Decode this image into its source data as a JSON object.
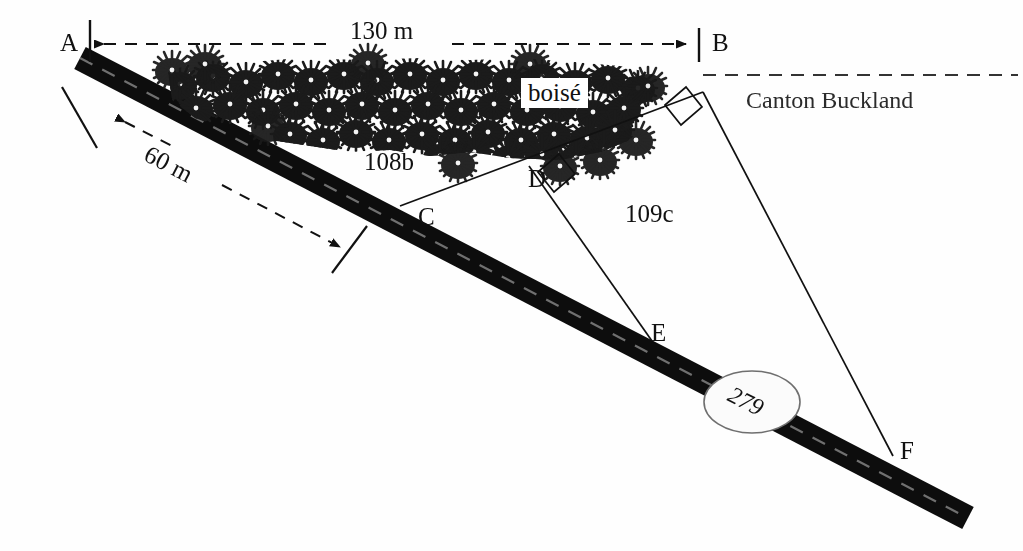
{
  "diagram": {
    "background_color": "#fefefe",
    "ink_color": "#111111",
    "road_color": "#111111",
    "points": [
      {
        "id": "A",
        "label": "A",
        "x": 68,
        "y": 45,
        "kind": "corner-marker"
      },
      {
        "id": "B",
        "label": "B",
        "x": 712,
        "y": 45,
        "kind": "corner-marker"
      },
      {
        "id": "C",
        "label": "C",
        "x": 418,
        "y": 217,
        "kind": "road-intersection"
      },
      {
        "id": "D",
        "label": "D",
        "x": 529,
        "y": 180,
        "kind": "line-vertex"
      },
      {
        "id": "E",
        "label": "E",
        "x": 652,
        "y": 334,
        "kind": "road-intersection"
      },
      {
        "id": "F",
        "label": "F",
        "x": 902,
        "y": 452,
        "kind": "road-intersection"
      }
    ],
    "parcels": [
      {
        "id": "108b",
        "label": "108b",
        "x": 364,
        "y": 161
      },
      {
        "id": "109c",
        "label": "109c",
        "x": 625,
        "y": 213
      }
    ],
    "dimensions": [
      {
        "id": "ab",
        "label": "130 m",
        "x": 350,
        "y": 30,
        "rotated": false,
        "from": "A",
        "to": "B",
        "style": "dashed-double-arrow"
      },
      {
        "id": "a60",
        "label": "60 m",
        "x": 115,
        "y": 148,
        "rotated": true,
        "from": "A",
        "to": "road-tick",
        "style": "dashed-double-arrow"
      }
    ],
    "area_labels": [
      {
        "id": "boise",
        "label": "boisé",
        "x": 521,
        "y": 80
      }
    ],
    "boundary_labels": [
      {
        "id": "canton",
        "label": "Canton Buckland",
        "x": 746,
        "y": 92
      }
    ],
    "road": {
      "id": "279",
      "number_label": "279",
      "badge_shape": "ellipse",
      "badge_x": 752,
      "badge_y": 402
    },
    "right_angle_markers": [
      {
        "id": "at-d",
        "x": 555,
        "y": 166
      },
      {
        "id": "at-b",
        "x": 684,
        "y": 96
      }
    ],
    "features": {
      "forest_symbol": "tree-cluster",
      "forest_description": "dense cluster of stylised tree glyphs",
      "dashed_boundary": "township-line"
    }
  }
}
